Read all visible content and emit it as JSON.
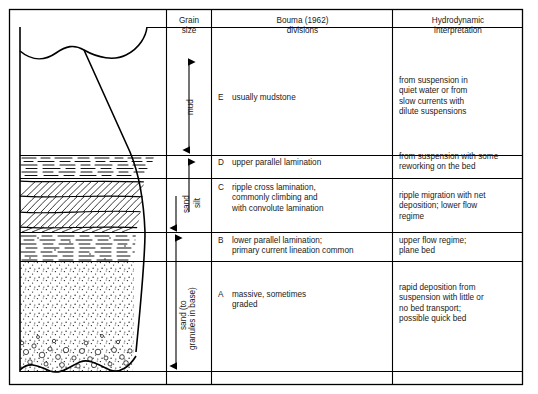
{
  "figure": {
    "type": "bouma-sequence-diagram",
    "columns": [
      {
        "id": "lithology",
        "header": ""
      },
      {
        "id": "grain_size",
        "header": "Grain\nsize"
      },
      {
        "id": "bouma",
        "header": "Bouma (1962)\ndivisions"
      },
      {
        "id": "hydrodynamic",
        "header": "Hydrodynamic\ninterpretation"
      }
    ]
  },
  "headers": {
    "grain_size": "Grain\nsize",
    "bouma": "Bouma (1962)\ndivisions",
    "hydro": "Hydrodynamic\ninterpretation"
  },
  "grain_size_labels": [
    {
      "id": "mud",
      "text": "mud"
    },
    {
      "id": "silt",
      "text": "silt"
    },
    {
      "id": "sand",
      "text": "sand"
    },
    {
      "id": "sand_to_granules",
      "text": "sand (to"
    },
    {
      "id": "granules_in_base",
      "text": "granules in base)"
    }
  ],
  "divisions": [
    {
      "letter": "E",
      "bouma": "usually mudstone",
      "hydro": "from suspension in\nquiet water or from\nslow currents with\ndilute suspensions"
    },
    {
      "letter": "D",
      "bouma": "upper parallel lamination",
      "hydro": "from suspension with some\nreworking on the bed"
    },
    {
      "letter": "C",
      "bouma": "ripple cross lamination,\ncommonly climbing and\nwith convolute lamination",
      "hydro": "ripple migration with net\ndeposition; lower flow\nregime"
    },
    {
      "letter": "B",
      "bouma": "lower parallel lamination;\nprimary current lineation common",
      "hydro": "upper flow regime;\nplane bed"
    },
    {
      "letter": "A",
      "bouma": "massive, sometimes\ngraded",
      "hydro": "rapid deposition from\nsuspension with little or\nno bed transport;\npossible quick bed"
    }
  ],
  "colors": {
    "line": "#000000",
    "text": "#1a1a1a",
    "background": "#ffffff"
  }
}
